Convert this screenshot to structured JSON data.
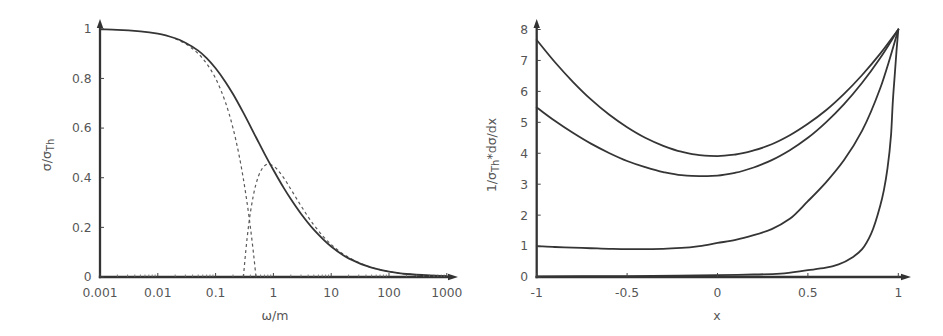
{
  "chart_data": [
    {
      "type": "line",
      "title": "",
      "xlabel": "ω/m",
      "ylabel": "σ/σTh",
      "ylabel_parts": [
        "σ/σ",
        "Th"
      ],
      "xscale": "log",
      "xlim": [
        0.001,
        1000
      ],
      "ylim": [
        0,
        1
      ],
      "xticks": [
        0.001,
        0.01,
        0.1,
        1,
        10,
        100,
        1000
      ],
      "xtick_labels": [
        "0.001",
        "0.01",
        "0.1",
        "1",
        "10",
        "100",
        "1000"
      ],
      "yticks": [
        0,
        0.2,
        0.4,
        0.6,
        0.8,
        1
      ],
      "ytick_labels": [
        "0",
        "0.2",
        "0.4",
        "0.6",
        "0.8",
        "1"
      ],
      "grid": false,
      "legend": null,
      "series": [
        {
          "name": "dashed-low-energy",
          "style": "dashed",
          "x": [
            0.02,
            0.03,
            0.05,
            0.07,
            0.1,
            0.15,
            0.2,
            0.25,
            0.3,
            0.35,
            0.4,
            0.45,
            0.5
          ],
          "y": [
            0.96,
            0.94,
            0.9,
            0.86,
            0.8,
            0.7,
            0.6,
            0.5,
            0.4,
            0.3,
            0.2,
            0.1,
            0.0
          ]
        },
        {
          "name": "dashed-high-energy",
          "style": "dashed",
          "x": [
            0.303,
            0.31,
            0.32,
            0.35,
            0.4,
            0.5,
            0.6,
            0.7,
            0.8,
            1,
            1.5,
            2,
            3,
            5,
            10,
            20,
            50,
            100,
            200,
            500,
            1000
          ],
          "y": [
            0.0,
            0.027,
            0.063,
            0.154,
            0.26,
            0.375,
            0.426,
            0.448,
            0.455,
            0.447,
            0.4,
            0.354,
            0.287,
            0.21,
            0.131,
            0.079,
            0.038,
            0.022,
            0.012,
            0.006,
            0.003
          ]
        },
        {
          "name": "solid",
          "style": "solid",
          "x": [
            0.001,
            0.002,
            0.005,
            0.01,
            0.02,
            0.03,
            0.05,
            0.07,
            0.1,
            0.15,
            0.2,
            0.3,
            0.5,
            0.7,
            1,
            1.5,
            2,
            3,
            5,
            10,
            20,
            50,
            100,
            200,
            500,
            1000
          ],
          "y": [
            0.998,
            0.996,
            0.99,
            0.981,
            0.962,
            0.944,
            0.912,
            0.882,
            0.841,
            0.784,
            0.737,
            0.663,
            0.563,
            0.497,
            0.431,
            0.36,
            0.314,
            0.255,
            0.191,
            0.123,
            0.075,
            0.038,
            0.022,
            0.012,
            0.006,
            0.003
          ]
        }
      ]
    },
    {
      "type": "line",
      "title": "",
      "xlabel": "x",
      "ylabel": "1/σTh*dσ/dx",
      "ylabel_parts": [
        "1/σ",
        "Th",
        "*dσ/dx"
      ],
      "xscale": "linear",
      "xlim": [
        -1,
        1
      ],
      "ylim": [
        0,
        8
      ],
      "xticks": [
        -1,
        -0.5,
        0,
        0.5,
        1
      ],
      "xtick_labels": [
        "-1",
        "-0.5",
        "0",
        "0.5",
        "1"
      ],
      "yticks": [
        0,
        1,
        2,
        3,
        4,
        5,
        6,
        7,
        8
      ],
      "ytick_labels": [
        "0",
        "1",
        "2",
        "3",
        "4",
        "5",
        "6",
        "7",
        "8"
      ],
      "grid": false,
      "legend": null,
      "series": [
        {
          "name": "curve-1",
          "style": "solid",
          "x": [
            -1,
            -0.9,
            -0.8,
            -0.7,
            -0.6,
            -0.5,
            -0.4,
            -0.3,
            -0.2,
            -0.1,
            0,
            0.1,
            0.2,
            0.3,
            0.4,
            0.5,
            0.6,
            0.7,
            0.8,
            0.9,
            1
          ],
          "y": [
            7.66,
            6.95,
            6.31,
            5.74,
            5.25,
            4.84,
            4.5,
            4.24,
            4.05,
            3.94,
            3.91,
            3.96,
            4.09,
            4.29,
            4.58,
            4.95,
            5.39,
            5.92,
            6.53,
            7.22,
            8.0
          ]
        },
        {
          "name": "curve-2",
          "style": "solid",
          "x": [
            -1,
            -0.9,
            -0.8,
            -0.7,
            -0.6,
            -0.5,
            -0.4,
            -0.3,
            -0.2,
            -0.1,
            0,
            0.1,
            0.2,
            0.3,
            0.4,
            0.5,
            0.6,
            0.7,
            0.8,
            0.9,
            1
          ],
          "y": [
            5.48,
            5.05,
            4.66,
            4.31,
            4.01,
            3.75,
            3.55,
            3.39,
            3.29,
            3.26,
            3.28,
            3.37,
            3.54,
            3.78,
            4.1,
            4.5,
            5.0,
            5.59,
            6.28,
            7.08,
            8.0
          ]
        },
        {
          "name": "curve-3",
          "style": "solid",
          "x": [
            -1,
            -0.9,
            -0.8,
            -0.7,
            -0.6,
            -0.5,
            -0.4,
            -0.3,
            -0.2,
            -0.1,
            0,
            0.1,
            0.2,
            0.3,
            0.4,
            0.5,
            0.6,
            0.7,
            0.8,
            0.9,
            0.95,
            1
          ],
          "y": [
            1.0,
            0.97,
            0.95,
            0.93,
            0.91,
            0.9,
            0.9,
            0.91,
            0.94,
            1.0,
            1.1,
            1.2,
            1.35,
            1.55,
            1.88,
            2.45,
            3.06,
            3.78,
            4.73,
            6.1,
            7.0,
            8.0
          ]
        },
        {
          "name": "curve-4",
          "style": "solid",
          "x": [
            -1,
            -0.5,
            0,
            0.2,
            0.35,
            0.5,
            0.6,
            0.67,
            0.75,
            0.8,
            0.85,
            0.9,
            0.92,
            0.94,
            0.96,
            0.97,
            0.98,
            0.99,
            1
          ],
          "y": [
            0.02,
            0.03,
            0.06,
            0.08,
            0.11,
            0.22,
            0.3,
            0.41,
            0.65,
            0.9,
            1.4,
            2.3,
            2.8,
            3.5,
            4.6,
            5.7,
            6.5,
            7.3,
            8.0
          ]
        }
      ]
    }
  ]
}
